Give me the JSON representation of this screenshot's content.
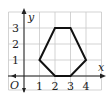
{
  "figure": {
    "type": "coordinate-grid-diagram",
    "axes": {
      "x_label": "x",
      "y_label": "y",
      "origin_label": "O",
      "x_ticks": [
        "1",
        "2",
        "3",
        "4"
      ],
      "y_ticks": [
        "1",
        "2",
        "3"
      ]
    },
    "grid": {
      "x_min": -1,
      "x_max": 5,
      "y_min": -0.75,
      "y_max": 4
    },
    "shape": {
      "name": "hexagon",
      "vertices": [
        [
          1,
          1
        ],
        [
          2,
          3
        ],
        [
          3,
          3
        ],
        [
          4,
          1
        ],
        [
          3,
          0
        ],
        [
          2,
          0
        ]
      ]
    },
    "colors": {
      "grid": "#c8c8c8",
      "axis": "#222222",
      "shape": "#111111"
    }
  }
}
